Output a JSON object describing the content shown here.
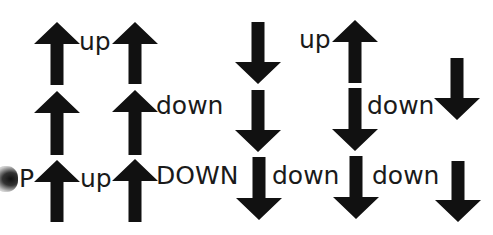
{
  "colors": {
    "arrow": "#111111",
    "text": "#1a1a1a",
    "background": "#ffffff"
  },
  "labels": [
    {
      "text": "up",
      "x": 79,
      "y": 29
    },
    {
      "text": "up",
      "x": 299,
      "y": 27
    },
    {
      "text": "down",
      "x": 156,
      "y": 93
    },
    {
      "text": "down",
      "x": 367,
      "y": 93
    },
    {
      "text": "P",
      "x": 19,
      "y": 166
    },
    {
      "text": "up",
      "x": 80,
      "y": 166
    },
    {
      "text": "DOWN",
      "x": 156,
      "y": 163
    },
    {
      "text": "down",
      "x": 272,
      "y": 163
    },
    {
      "text": "down",
      "x": 372,
      "y": 163
    }
  ],
  "arrows": [
    {
      "dir": "up",
      "x": 57,
      "top": 22,
      "bottom": 85
    },
    {
      "dir": "up",
      "x": 57,
      "top": 91,
      "bottom": 155
    },
    {
      "dir": "up",
      "x": 57,
      "top": 160,
      "bottom": 222
    },
    {
      "dir": "up",
      "x": 135,
      "top": 22,
      "bottom": 84
    },
    {
      "dir": "up",
      "x": 135,
      "top": 90,
      "bottom": 155
    },
    {
      "dir": "up",
      "x": 135,
      "top": 159,
      "bottom": 222
    },
    {
      "dir": "down",
      "x": 258,
      "top": 22,
      "bottom": 84
    },
    {
      "dir": "down",
      "x": 258,
      "top": 90,
      "bottom": 152
    },
    {
      "dir": "down",
      "x": 259,
      "top": 157,
      "bottom": 220
    },
    {
      "dir": "up",
      "x": 355,
      "top": 20,
      "bottom": 83
    },
    {
      "dir": "down",
      "x": 355,
      "top": 88,
      "bottom": 151
    },
    {
      "dir": "down",
      "x": 356,
      "top": 156,
      "bottom": 219
    },
    {
      "dir": "down",
      "x": 457,
      "top": 58,
      "bottom": 120
    },
    {
      "dir": "down",
      "x": 458,
      "top": 161,
      "bottom": 222
    }
  ]
}
